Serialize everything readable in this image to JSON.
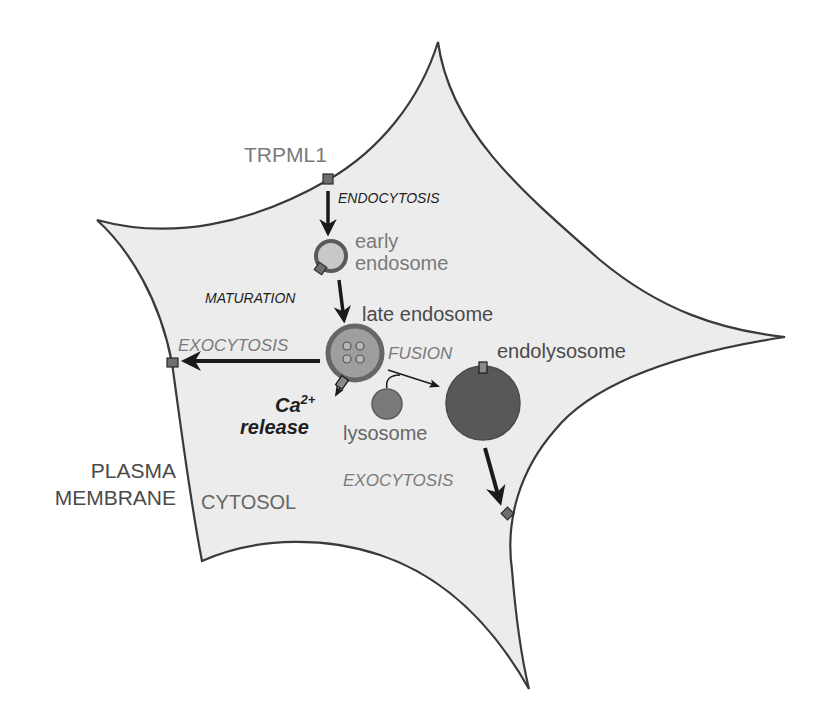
{
  "diagram": {
    "colors": {
      "cell_fill": "#ececec",
      "outline": "#3a3a3a",
      "channel": "#6e6e6e",
      "early_endosome_ring": "#5a5a5a",
      "early_endosome_fill": "#c8c8c8",
      "late_endosome_ring": "#666666",
      "late_endosome_fill": "#9e9e9e",
      "lysosome": "#7a7a7a",
      "endolysosome": "#585858",
      "arrow": "#1a1a1a"
    },
    "labels": {
      "trpml1": "TRPML1",
      "endocytosis": "ENDOCYTOSIS",
      "early_endosome_line1": "early",
      "early_endosome_line2": "endosome",
      "maturation": "MATURATION",
      "late_endosome": "late endosome",
      "exocytosis_left": "EXOCYTOSIS",
      "fusion": "FUSION",
      "endolysosome": "endolysosome",
      "ca_release_ion": "Ca",
      "ca_release_charge": "2+",
      "ca_release_word": "release",
      "lysosome": "lysosome",
      "plasma_membrane_line1": "PLASMA",
      "plasma_membrane_line2": "MEMBRANE",
      "exocytosis_right": "EXOCYTOSIS",
      "cytosol": "CYTOSOL"
    },
    "nodes": [
      {
        "id": "early-endosome",
        "label": "early endosome"
      },
      {
        "id": "late-endosome",
        "label": "late endosome"
      },
      {
        "id": "lysosome",
        "label": "lysosome"
      },
      {
        "id": "endolysosome",
        "label": "endolysosome"
      }
    ],
    "edges": [
      {
        "from": "plasma-membrane",
        "to": "early-endosome",
        "label": "ENDOCYTOSIS"
      },
      {
        "from": "early-endosome",
        "to": "late-endosome",
        "label": "MATURATION"
      },
      {
        "from": "late-endosome",
        "to": "plasma-membrane",
        "label": "EXOCYTOSIS"
      },
      {
        "from": "late-endosome+lysosome",
        "to": "endolysosome",
        "label": "FUSION"
      },
      {
        "from": "endolysosome",
        "to": "plasma-membrane",
        "label": "EXOCYTOSIS"
      },
      {
        "from": "late-endosome",
        "to": "cytosol",
        "label": "Ca2+ release"
      }
    ]
  }
}
